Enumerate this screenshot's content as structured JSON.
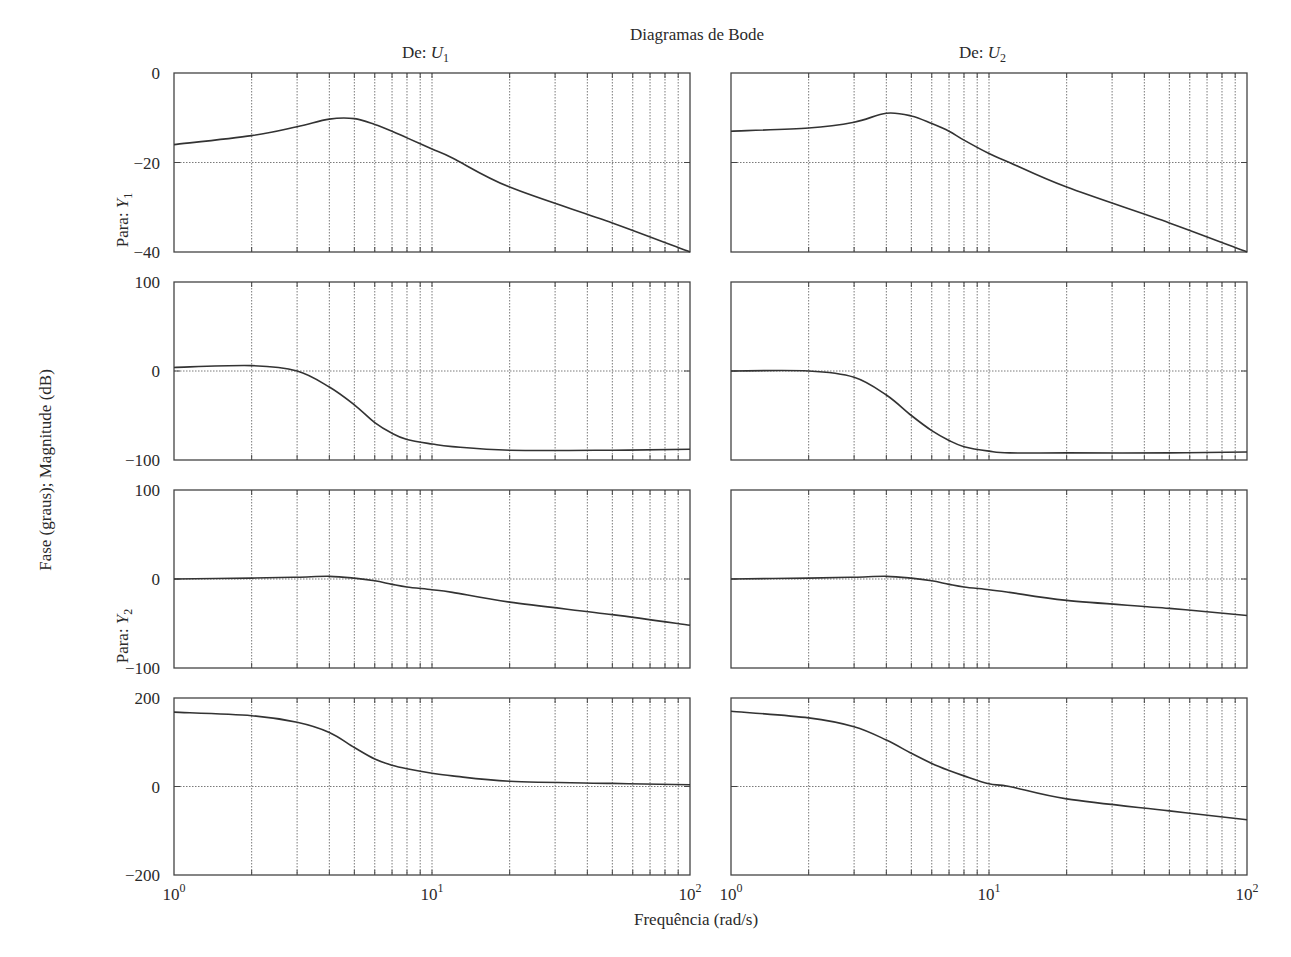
{
  "chart_data": {
    "type": "line",
    "title": "Diagramas de Bode",
    "xlabel": "Frequência (rad/s)",
    "ylabel": "Fase (graus); Magnitude (dB)",
    "xscale": "log",
    "xlim": [
      1,
      100
    ],
    "x_tick_labels": [
      "10^0",
      "10^1",
      "10^2"
    ],
    "grid": true,
    "columns": [
      {
        "label_prefix": "De: ",
        "label_var": "U",
        "label_sub": "1"
      },
      {
        "label_prefix": "De: ",
        "label_var": "U",
        "label_sub": "2"
      }
    ],
    "rows": [
      {
        "label_prefix": "Para: ",
        "label_var": "Y",
        "label_sub": "1"
      },
      {
        "label_prefix": "Para: ",
        "label_var": "Y",
        "label_sub": "2"
      }
    ],
    "x": [
      1,
      2,
      3,
      4,
      5,
      6,
      7,
      8,
      10,
      12,
      20,
      50,
      100
    ],
    "panels": [
      {
        "name": "U1→Y1 magnitude (dB)",
        "row": 0,
        "col": 0,
        "ylim": [
          -40,
          0
        ],
        "yticks": [
          0,
          -20,
          -40
        ],
        "values": [
          -16,
          -14,
          -12,
          -10.3,
          -10.2,
          -11.5,
          -13,
          -14.5,
          -17,
          -19,
          -25.5,
          -33.5,
          -40
        ]
      },
      {
        "name": "U2→Y1 magnitude (dB)",
        "row": 0,
        "col": 1,
        "ylim": [
          -40,
          0
        ],
        "yticks": [
          0,
          -20,
          -40
        ],
        "values": [
          -13,
          -12.3,
          -11,
          -9,
          -9.6,
          -11.3,
          -13,
          -15,
          -18,
          -20,
          -25.5,
          -33.5,
          -40
        ]
      },
      {
        "name": "U1→Y1 phase (graus)",
        "row": 1,
        "col": 0,
        "ylim": [
          -100,
          100
        ],
        "yticks": [
          100,
          0,
          -100
        ],
        "values": [
          4,
          6,
          0,
          -18,
          -38,
          -58,
          -70,
          -77,
          -82,
          -85,
          -89,
          -89,
          -88
        ]
      },
      {
        "name": "U2→Y1 phase (graus)",
        "row": 1,
        "col": 1,
        "ylim": [
          -100,
          100
        ],
        "yticks": [
          100,
          0,
          -100
        ],
        "values": [
          0,
          0,
          -7,
          -27,
          -50,
          -67,
          -78,
          -85,
          -90,
          -92,
          -92,
          -92,
          -91
        ]
      },
      {
        "name": "U1→Y2 magnitude (dB)",
        "row": 2,
        "col": 0,
        "ylim": [
          -100,
          100
        ],
        "yticks": [
          100,
          0,
          -100
        ],
        "values": [
          0,
          1,
          2,
          3,
          1,
          -2,
          -6,
          -9,
          -12,
          -15,
          -26,
          -40,
          -52
        ]
      },
      {
        "name": "U2→Y2 magnitude (dB)",
        "row": 2,
        "col": 1,
        "ylim": [
          -100,
          100
        ],
        "yticks": [
          100,
          0,
          -100
        ],
        "values": [
          0,
          1,
          2,
          3,
          1,
          -2,
          -6,
          -9,
          -12,
          -15,
          -24,
          -33,
          -41
        ]
      },
      {
        "name": "U1→Y2 phase (graus)",
        "row": 3,
        "col": 0,
        "ylim": [
          -200,
          200
        ],
        "yticks": [
          200,
          0,
          -200
        ],
        "values": [
          168,
          160,
          145,
          122,
          88,
          62,
          48,
          40,
          30,
          24,
          12,
          7,
          4
        ]
      },
      {
        "name": "U2→Y2 phase (graus)",
        "row": 3,
        "col": 1,
        "ylim": [
          -200,
          200
        ],
        "yticks": [
          200,
          0,
          -200
        ],
        "values": [
          170,
          155,
          135,
          105,
          75,
          52,
          36,
          24,
          6,
          0,
          -28,
          -55,
          -75
        ]
      }
    ]
  },
  "labels": {
    "title": "Diagramas de Bode",
    "xlabel": "Frequência (rad/s)",
    "ylabel": "Fase (graus); Magnitude (dB)"
  },
  "colors": {
    "curve": "#333333",
    "frame": "#444444",
    "grid": "#7a7a7a",
    "text": "#2a2a2a"
  }
}
